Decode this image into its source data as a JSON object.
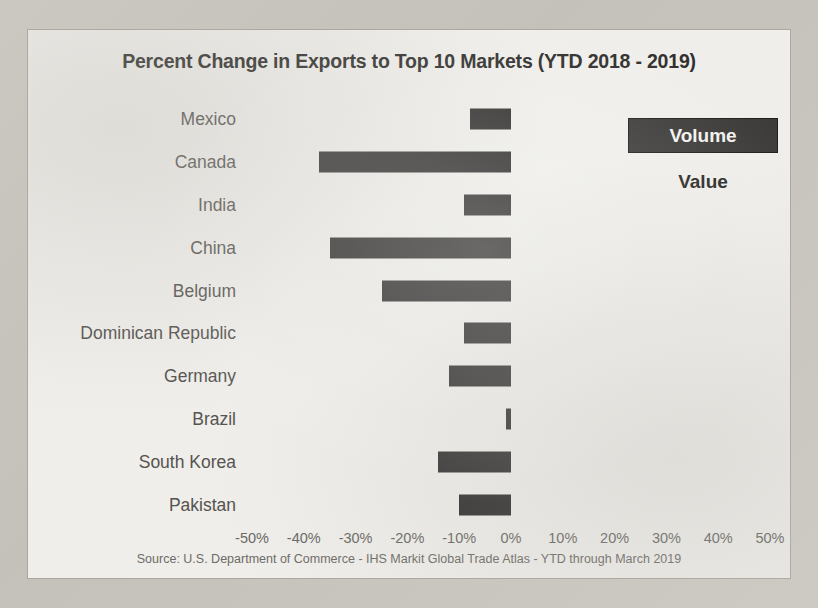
{
  "chart_title": "Percent Change in Exports to Top 10 Markets (YTD 2018 - 2019)",
  "source_note": "Source: U.S. Department of Commerce - IHS Markit Global Trade Atlas - YTD through March 2019",
  "legend": {
    "active_label": "Volume",
    "inactive_label": "Value",
    "active_color": "#3a3937",
    "active_text_color": "#f2f1ee",
    "inactive_text_color": "#242321"
  },
  "chart_data": {
    "type": "bar",
    "orientation": "horizontal",
    "title": "Percent Change in Exports to Top 10 Markets (YTD 2018 - 2019)",
    "xlabel": "",
    "ylabel": "",
    "xlim": [
      -50,
      50
    ],
    "xticks": [
      -50,
      -40,
      -30,
      -20,
      -10,
      0,
      10,
      20,
      30,
      40,
      50
    ],
    "xtick_labels": [
      "-50%",
      "-40%",
      "-30%",
      "-20%",
      "-10%",
      "0%",
      "10%",
      "20%",
      "30%",
      "40%",
      "50%"
    ],
    "grid": false,
    "legend_position": "top-right",
    "bar_color": "#2f2e2d",
    "series_name": "Volume",
    "categories": [
      "Mexico",
      "Canada",
      "India",
      "China",
      "Belgium",
      "Dominican Republic",
      "Germany",
      "Brazil",
      "South Korea",
      "Pakistan"
    ],
    "values": [
      -8,
      -37,
      -9,
      -35,
      -25,
      -9,
      -12,
      -1,
      -14,
      -10
    ],
    "units": "percent"
  }
}
